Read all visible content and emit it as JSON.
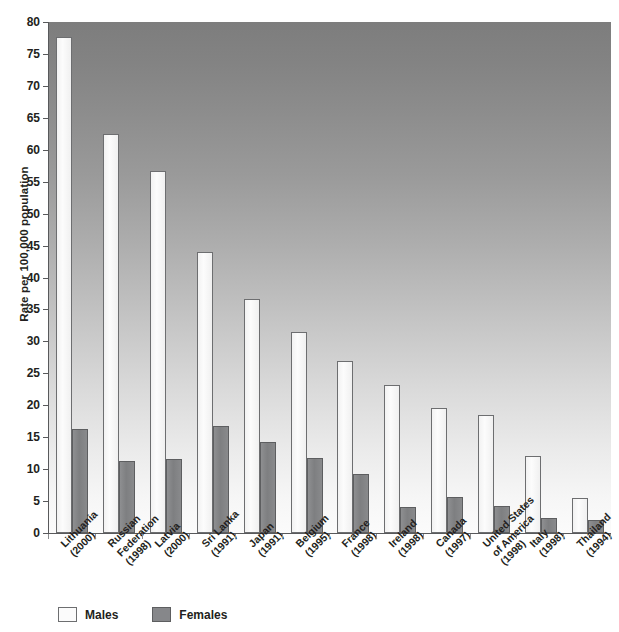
{
  "chart_data": {
    "type": "bar",
    "title": "",
    "xlabel": "",
    "ylabel": "Rate per 100,000 population",
    "ylim": [
      0,
      80
    ],
    "ytick_step": 5,
    "yticks": [
      "0",
      "5",
      "10",
      "15",
      "20",
      "25",
      "30",
      "35",
      "40",
      "45",
      "50",
      "55",
      "60",
      "65",
      "70",
      "75",
      "80"
    ],
    "grid": false,
    "legend_position": "bottom-left",
    "categories": [
      "Lithuania (2000)",
      "Russian Federation (1998)",
      "Latvia (2000)",
      "Sri Lanka (1991)",
      "Japan (1991)",
      "Belgium (1995)",
      "France (1998)",
      "Ireland (1998)",
      "Canada (1997)",
      "United States of America (1998)",
      "Italy (1998)",
      "Thailand (1994)"
    ],
    "category_lines": [
      [
        "Lithuania",
        "(2000)"
      ],
      [
        "Russian",
        "Federation",
        "(1998)"
      ],
      [
        "Latvia",
        "(2000)"
      ],
      [
        "Sri Lanka",
        "(1991)"
      ],
      [
        "Japan",
        "(1991)"
      ],
      [
        "Belgium",
        "(1995)"
      ],
      [
        "France",
        "(1998)"
      ],
      [
        "Ireland",
        "(1998)"
      ],
      [
        "Canada",
        "(1997)"
      ],
      [
        "United States",
        "of America",
        "(1998)"
      ],
      [
        "Italy",
        "(1998)"
      ],
      [
        "Thailand",
        "(1994)"
      ]
    ],
    "series": [
      {
        "name": "Males",
        "color": "#fbfbfb",
        "values": [
          77.6,
          62.4,
          56.6,
          44.0,
          36.6,
          31.4,
          27.0,
          23.2,
          19.6,
          18.4,
          12.0,
          5.5
        ]
      },
      {
        "name": "Females",
        "color": "#86878a",
        "values": [
          16.3,
          11.3,
          11.6,
          16.7,
          14.3,
          11.7,
          9.3,
          4.1,
          5.6,
          4.2,
          2.4,
          2.1
        ]
      }
    ]
  },
  "legend": {
    "items": [
      {
        "label": "Males",
        "swatch": "males"
      },
      {
        "label": "Females",
        "swatch": "females"
      }
    ]
  }
}
